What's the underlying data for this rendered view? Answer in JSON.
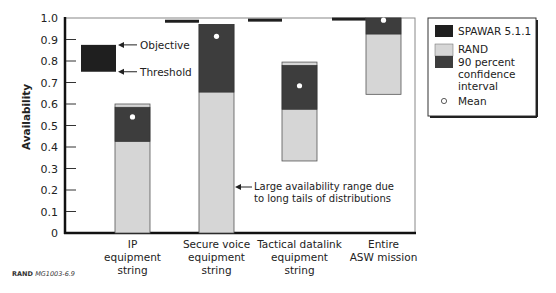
{
  "chart_data": {
    "type": "bar",
    "title": "",
    "xlabel": "",
    "ylabel": "Availability",
    "ylim": [
      0,
      1.0
    ],
    "yticks": [
      "0",
      "0.1",
      "0.2",
      "0.3",
      "0.4",
      "0.5",
      "0.6",
      "0.7",
      "0.8",
      "0.9",
      "1.0"
    ],
    "grid": false,
    "legend_position": "right",
    "categories": [
      "IP equipment string",
      "Secure voice equipment string",
      "Tactical datalink equipment string",
      "Entire ASW mission"
    ],
    "category_lines": [
      [
        "IP",
        "equipment",
        "string"
      ],
      [
        "Secure voice",
        "equipment",
        "string"
      ],
      [
        "Tactical datalink",
        "equipment",
        "string"
      ],
      [
        "Entire",
        "ASW mission"
      ]
    ],
    "series": [
      {
        "name": "SPAWAR 5.1.1",
        "color": "#2a2a2a",
        "values": [
          null,
          0.985,
          0.99,
          0.995
        ]
      },
      {
        "name": "RAND range (min-max)",
        "color": "#d4d4d4",
        "low": [
          0.0,
          0.0,
          0.335,
          0.645
        ],
        "high": [
          0.6,
          0.97,
          0.795,
          1.0
        ]
      },
      {
        "name": "90 percent confidence interval",
        "color": "#3c3c3c",
        "low": [
          0.425,
          0.655,
          0.575,
          0.925
        ],
        "high": [
          0.585,
          0.97,
          0.78,
          1.0
        ]
      },
      {
        "name": "Mean",
        "values": [
          0.54,
          0.915,
          0.685,
          0.99
        ]
      }
    ],
    "key_box": {
      "objective": 0.875,
      "threshold": 0.75,
      "objective_label": "Objective",
      "threshold_label": "Threshold"
    },
    "annotations": [
      {
        "text_lines": [
          "Large availability range due",
          "to long tails of distributions"
        ],
        "points_to": "Secure voice equipment string"
      }
    ],
    "legend": [
      {
        "label": "SPAWAR 5.1.1",
        "swatch": "dark"
      },
      {
        "label": "RAND",
        "swatch": "light"
      },
      {
        "label_lines": [
          "90 percent",
          "confidence",
          "interval"
        ],
        "swatch": "dark-gray"
      },
      {
        "label": "Mean",
        "swatch": "circle"
      }
    ]
  },
  "credit": {
    "bold": "RAND",
    "rest": "MG1003-6.9"
  },
  "colors": {
    "spawar": "#1f1f1f",
    "rand_light": "#d6d6d6",
    "ci_dark": "#3d3d3d",
    "axis": "#111111"
  }
}
